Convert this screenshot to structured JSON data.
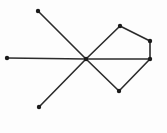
{
  "figure": {
    "width": 167,
    "height": 133,
    "background_color": "#fdfdfd",
    "edge_color": "#2b2b2b",
    "node_color": "#1b1b1b",
    "edge_stroke_width": 1.6,
    "node_radius": 2.2,
    "node_count": 8,
    "edge_count": 8,
    "caption": ""
  },
  "chart_data": {
    "type": "scatter",
    "title": "",
    "xlabel": "",
    "ylabel": "",
    "xlim": [
      0,
      167
    ],
    "ylim": [
      0,
      133
    ],
    "grid": false,
    "legend": "none",
    "nodes": [
      {
        "id": "A",
        "label": "",
        "x": 38,
        "y": 11,
        "degree": 1
      },
      {
        "id": "B",
        "label": "",
        "x": 7,
        "y": 58,
        "degree": 1
      },
      {
        "id": "C",
        "label": "",
        "x": 39,
        "y": 107,
        "degree": 1
      },
      {
        "id": "D",
        "label": "",
        "x": 86,
        "y": 59,
        "degree": 5
      },
      {
        "id": "E",
        "label": "",
        "x": 120,
        "y": 26,
        "degree": 2
      },
      {
        "id": "F",
        "label": "",
        "x": 150,
        "y": 41,
        "degree": 2
      },
      {
        "id": "G",
        "label": "",
        "x": 119,
        "y": 91,
        "degree": 2
      },
      {
        "id": "H",
        "label": "",
        "x": 150,
        "y": 59,
        "degree": 3
      }
    ],
    "edges": [
      {
        "id": "e1",
        "source": "A",
        "target": "D"
      },
      {
        "id": "e2",
        "source": "B",
        "target": "D"
      },
      {
        "id": "e3",
        "source": "C",
        "target": "D"
      },
      {
        "id": "e4",
        "source": "D",
        "target": "E"
      },
      {
        "id": "e5",
        "source": "D",
        "target": "G"
      },
      {
        "id": "e6",
        "source": "D",
        "target": "H"
      },
      {
        "id": "e7",
        "source": "E",
        "target": "F"
      },
      {
        "id": "e8",
        "source": "F",
        "target": "H"
      },
      {
        "id": "e9",
        "source": "G",
        "target": "H"
      }
    ]
  }
}
